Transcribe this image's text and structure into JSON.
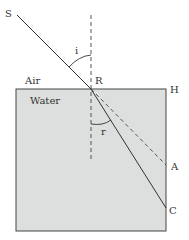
{
  "diagram": {
    "media": {
      "upper": "Air",
      "lower": "Water"
    },
    "points": {
      "source": "S",
      "incidence_point": "R",
      "surface_end": "H",
      "undeviated_point": "A",
      "refracted_point": "C"
    },
    "angles": {
      "incidence": "i",
      "refraction": "r"
    },
    "colors": {
      "water_fill": "#dcdfdd",
      "line": "#333333",
      "background": "#ffffff"
    }
  }
}
